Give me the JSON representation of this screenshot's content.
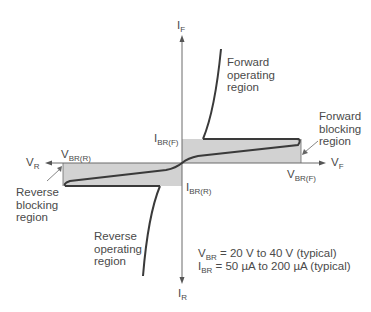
{
  "figure": {
    "type": "device characteristic curve",
    "axes": {
      "up": {
        "symbol": "I",
        "sub": "F"
      },
      "down": {
        "symbol": "I",
        "sub": "R"
      },
      "left": {
        "symbol": "V",
        "sub": "R"
      },
      "right": {
        "symbol": "V",
        "sub": "F"
      }
    },
    "markers": {
      "ibr_f": {
        "symbol": "I",
        "sub": "BR(F)"
      },
      "ibr_r": {
        "symbol": "I",
        "sub": "BR(R)"
      },
      "vbr_r": {
        "symbol": "V",
        "sub": "BR(R)"
      },
      "vbr_f": {
        "symbol": "V",
        "sub": "BR(F)"
      }
    },
    "regions": {
      "forward_operating": "Forward\noperating\nregion",
      "forward_blocking": "Forward\nblocking\nregion",
      "reverse_blocking": "Reverse\nblocking\nregion",
      "reverse_operating": "Reverse\noperating\nregion"
    },
    "notes": [
      {
        "symbol": "V",
        "sub": "BR",
        "text": " = 20 V to 40 V (typical)"
      },
      {
        "symbol": "I",
        "sub": "BR",
        "text": " = 50 µA to 200 µA (typical)"
      }
    ],
    "colors": {
      "shade": "#d2d2d2",
      "curve": "#3a3a3a",
      "axis": "#6a6a6a"
    }
  }
}
